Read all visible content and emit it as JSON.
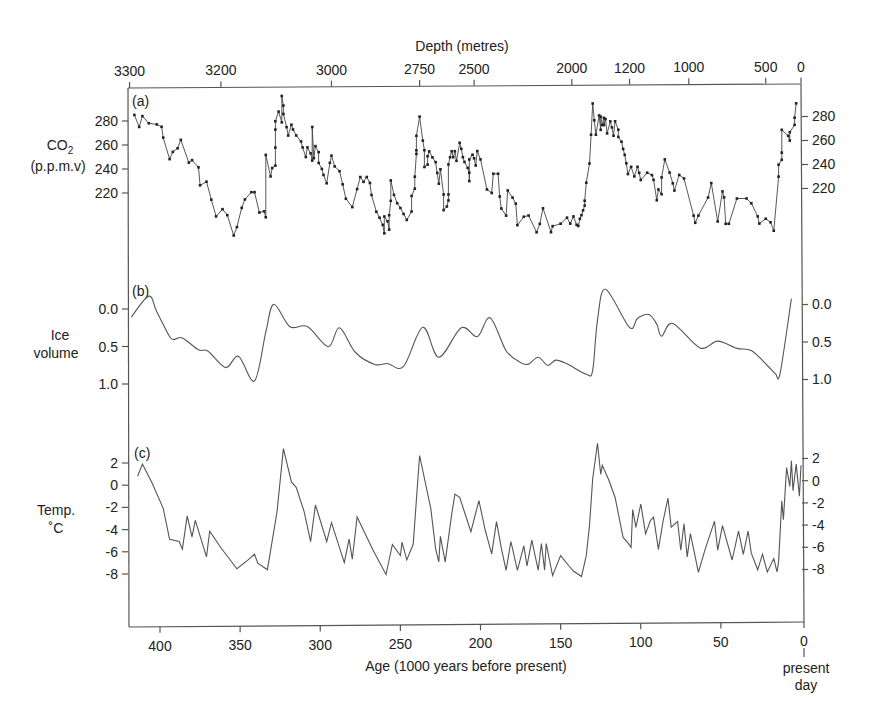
{
  "figure": {
    "top_axis_title": "Depth (metres)",
    "bottom_axis_title": "Age (1000 years before present)",
    "present_day_label_1": "present",
    "present_day_label_2": "day",
    "panels": {
      "a": {
        "tag": "(a)",
        "ylabel_main": "CO",
        "ylabel_sub": "2",
        "ylabel_unit": "(p.p.m.v)"
      },
      "b": {
        "tag": "(b)",
        "ylabel_1": "Ice",
        "ylabel_2": "volume"
      },
      "c": {
        "tag": "(c)",
        "ylabel_1": "Temp.",
        "ylabel_2": "˚C"
      }
    },
    "colors": {
      "line": "#555555",
      "marker": "#222222",
      "axis": "#555555",
      "background": "#ffffff"
    }
  },
  "chart_data": [
    {
      "panel": "(a)",
      "type": "line",
      "title": "",
      "xlabel": "Age (1000 years before present)",
      "ylabel": "CO2 (p.p.m.v)",
      "xlim": [
        420,
        0
      ],
      "ylim": [
        180,
        300
      ],
      "yticks": [
        220,
        240,
        260,
        280
      ],
      "markers": true,
      "secondary_xaxis": {
        "label": "Depth (metres)",
        "ticks": [
          {
            "label": "3300",
            "age": 419
          },
          {
            "label": "3200",
            "age": 362
          },
          {
            "label": "3000",
            "age": 293
          },
          {
            "label": "2750",
            "age": 238
          },
          {
            "label": "2500",
            "age": 204
          },
          {
            "label": "2000",
            "age": 143
          },
          {
            "label": "1200",
            "age": 107
          },
          {
            "label": "1000",
            "age": 70
          },
          {
            "label": "500",
            "age": 22
          },
          {
            "label": "0",
            "age": 0
          }
        ]
      },
      "x": [
        416,
        413,
        411,
        407,
        402,
        399,
        398,
        394,
        392,
        389,
        387,
        382,
        380,
        376,
        375,
        371,
        368,
        365,
        361,
        358,
        354,
        352,
        349,
        347,
        343,
        341,
        338,
        335,
        334,
        334,
        331,
        330,
        328,
        328,
        328,
        328,
        326,
        324,
        324,
        323,
        323,
        321,
        320,
        318,
        317,
        315,
        312,
        311,
        309,
        308,
        306,
        305,
        305,
        304,
        303,
        301,
        301,
        299,
        298,
        296,
        294,
        293,
        291,
        288,
        286,
        284,
        280,
        277,
        275,
        273,
        271,
        269,
        268,
        265,
        263,
        261,
        260,
        260,
        258,
        257,
        257,
        256,
        256,
        254,
        252,
        250,
        248,
        246,
        243,
        243,
        241,
        241,
        240,
        240,
        240,
        238,
        236,
        235,
        235,
        233,
        233,
        232,
        230,
        228,
        227,
        226,
        225,
        223,
        223,
        221,
        220,
        220,
        220,
        219,
        218,
        217,
        216,
        215,
        213,
        212,
        211,
        210,
        208,
        207,
        207,
        207,
        205,
        204,
        203,
        202,
        200,
        196,
        193,
        192,
        189,
        188,
        187,
        184,
        183,
        180,
        178,
        177,
        173,
        170,
        165,
        163,
        161,
        156,
        155,
        150,
        146,
        144,
        142,
        140,
        139,
        138,
        137,
        136,
        135,
        135,
        134,
        132,
        131,
        130,
        129,
        128,
        126,
        125,
        125,
        124,
        123,
        123,
        122,
        121,
        119,
        118,
        117,
        116,
        114,
        114,
        112,
        111,
        110,
        109,
        108,
        106,
        104,
        102,
        101,
        100,
        96,
        93,
        92,
        90,
        89,
        87,
        87,
        85,
        82,
        80,
        79,
        76,
        73,
        67,
        66,
        64,
        58,
        56,
        52,
        49,
        48,
        47,
        45,
        40,
        34,
        31,
        27,
        26,
        22,
        19,
        17,
        14,
        14,
        12,
        12,
        12,
        8,
        7,
        7,
        4,
        4,
        3
      ],
      "y": [
        285,
        275,
        284,
        278,
        277,
        275,
        266,
        248,
        254,
        257,
        264,
        245,
        247,
        241,
        226,
        229,
        214,
        200,
        206,
        201,
        184,
        191,
        207,
        214,
        220,
        220,
        203,
        204,
        199,
        251,
        233,
        240,
        242,
        257,
        272,
        279,
        287,
        278,
        300,
        292,
        285,
        274,
        267,
        276,
        272,
        267,
        262,
        257,
        249,
        257,
        252,
        246,
        274,
        248,
        258,
        253,
        244,
        239,
        234,
        227,
        244,
        250,
        241,
        237,
        226,
        214,
        207,
        222,
        232,
        228,
        232,
        227,
        217,
        203,
        198,
        192,
        185,
        199,
        195,
        188,
        200,
        212,
        229,
        217,
        210,
        206,
        201,
        196,
        203,
        216,
        222,
        232,
        251,
        254,
        266,
        282,
        262,
        254,
        240,
        242,
        249,
        253,
        248,
        244,
        235,
        226,
        238,
        217,
        204,
        207,
        212,
        217,
        242,
        248,
        253,
        248,
        253,
        245,
        260,
        255,
        248,
        244,
        239,
        235,
        228,
        246,
        250,
        247,
        241,
        253,
        246,
        221,
        218,
        234,
        234,
        215,
        205,
        199,
        220,
        214,
        209,
        191,
        198,
        199,
        185,
        192,
        205,
        185,
        190,
        192,
        197,
        192,
        198,
        191,
        190,
        196,
        199,
        203,
        207,
        211,
        226,
        242,
        266,
        292,
        278,
        266,
        282,
        270,
        281,
        274,
        280,
        274,
        279,
        267,
        277,
        272,
        265,
        277,
        270,
        264,
        260,
        254,
        249,
        242,
        233,
        239,
        231,
        239,
        234,
        228,
        234,
        232,
        228,
        211,
        220,
        216,
        230,
        245,
        234,
        225,
        219,
        232,
        229,
        198,
        192,
        198,
        213,
        225,
        193,
        218,
        213,
        191,
        191,
        212,
        212,
        208,
        197,
        191,
        195,
        192,
        185,
        230,
        240,
        244,
        250,
        269,
        264,
        260,
        267,
        273,
        279,
        291
      ]
    },
    {
      "panel": "(b)",
      "type": "line",
      "title": "",
      "xlabel": "Age (1000 years before present)",
      "ylabel": "Ice volume",
      "xlim": [
        420,
        0
      ],
      "ylim": [
        1.5,
        -0.3
      ],
      "yticks": [
        0.0,
        0.5,
        1.0
      ],
      "y_inverted": true,
      "markers": false,
      "x": [
        418,
        407,
        402,
        394,
        391,
        386,
        376,
        370,
        359,
        351,
        341,
        334,
        329,
        319,
        308,
        295,
        288,
        278,
        266,
        258,
        248,
        236,
        226,
        212,
        202,
        194,
        184,
        175,
        170,
        164,
        158,
        153,
        146,
        134,
        130,
        127,
        122,
        107,
        102,
        95,
        90,
        87,
        80,
        63,
        52,
        40,
        31,
        21,
        16,
        13,
        6
      ],
      "y": [
        0.11,
        -0.17,
        0.04,
        0.37,
        0.41,
        0.39,
        0.55,
        0.57,
        0.79,
        0.64,
        0.97,
        0.32,
        -0.05,
        0.25,
        0.25,
        0.52,
        0.27,
        0.6,
        0.76,
        0.75,
        0.79,
        0.27,
        0.67,
        0.28,
        0.4,
        0.15,
        0.59,
        0.75,
        0.77,
        0.68,
        0.79,
        0.72,
        0.77,
        0.91,
        0.86,
        0.19,
        -0.22,
        0.29,
        0.17,
        0.12,
        0.25,
        0.41,
        0.24,
        0.57,
        0.48,
        0.58,
        0.61,
        0.81,
        0.92,
        0.91,
        -0.08
      ]
    },
    {
      "panel": "(c)",
      "type": "line",
      "title": "",
      "xlabel": "Age (1000 years before present)",
      "ylabel": "Temp. ˚C",
      "xlim": [
        420,
        0
      ],
      "ylim": [
        -12,
        4
      ],
      "yticks": [
        2,
        0,
        -2,
        -4,
        -6,
        -8
      ],
      "markers": false,
      "x": [
        414,
        411,
        405,
        398,
        394,
        388,
        386,
        383,
        380,
        378,
        371,
        369,
        362,
        352,
        345,
        341,
        339,
        333,
        327,
        323,
        318,
        315,
        310,
        306,
        303,
        300,
        296,
        293,
        285,
        282,
        280,
        277,
        267,
        259,
        255,
        250,
        249,
        246,
        242,
        238,
        231,
        228,
        226,
        225,
        222,
        218,
        216,
        213,
        206,
        201,
        197,
        193,
        190,
        187,
        184,
        181,
        177,
        173,
        171,
        168,
        164,
        162,
        160,
        159,
        155,
        150,
        145,
        142,
        137,
        134,
        132,
        130,
        127,
        125,
        124,
        120,
        116,
        111,
        108,
        106,
        105,
        103,
        100,
        97,
        94,
        92,
        89,
        86,
        83,
        81,
        77,
        75,
        73,
        71,
        69,
        64,
        60,
        54,
        52,
        49,
        43,
        39,
        36,
        33,
        31,
        27,
        24,
        21,
        17,
        15,
        14,
        12,
        11,
        9,
        7,
        6,
        5,
        3,
        1,
        0
      ],
      "y": [
        0.8,
        1.9,
        0.2,
        -2.1,
        -4.9,
        -5.1,
        -5.8,
        -2.8,
        -4.7,
        -3.2,
        -6.5,
        -4.2,
        -5.7,
        -7.6,
        -6.8,
        -6.3,
        -7.1,
        -7.7,
        -2.5,
        3.2,
        0.2,
        -0.3,
        -2.5,
        -5.2,
        -1.9,
        -3.3,
        -5.2,
        -3.5,
        -7.1,
        -5.0,
        -6.8,
        -3.0,
        -6.0,
        -8.2,
        -5.5,
        -6.5,
        -5.3,
        -6.9,
        -5.5,
        2.5,
        -2.3,
        -5.9,
        -7.1,
        -4.8,
        -7.1,
        -2.8,
        -1.0,
        -1.3,
        -4.4,
        -1.6,
        -4.3,
        -6.4,
        -3.5,
        -5.9,
        -7.9,
        -5.3,
        -7.9,
        -5.7,
        -7.5,
        -5.2,
        -7.9,
        -5.5,
        -7.9,
        -5.5,
        -8.4,
        -6.6,
        -7.5,
        -8.0,
        -8.5,
        -6.6,
        -3.9,
        0.3,
        3.5,
        0.7,
        1.5,
        0.2,
        -1.4,
        -5.0,
        -5.5,
        -5.9,
        -2.5,
        -4.1,
        -2.0,
        -4.7,
        -3.5,
        -3.2,
        -6.1,
        -3.5,
        -1.5,
        -4.1,
        -3.6,
        -6.2,
        -3.8,
        -6.8,
        -4.7,
        -8.2,
        -6.2,
        -3.6,
        -6.2,
        -4.0,
        -7.1,
        -4.5,
        -6.6,
        -4.5,
        -6.5,
        -8.0,
        -6.6,
        -8.2,
        -7.0,
        -8.2,
        -7.3,
        -1.8,
        -3.5,
        1.2,
        -0.5,
        1.8,
        -0.9,
        1.5,
        -1.4,
        1.4
      ]
    }
  ],
  "axes": {
    "age_ticks": [
      "400",
      "350",
      "300",
      "250",
      "200",
      "150",
      "100",
      "50",
      "0"
    ],
    "age_tick_values": [
      400,
      350,
      300,
      250,
      200,
      150,
      100,
      50,
      0
    ],
    "co2_ticks": [
      "220",
      "240",
      "260",
      "280"
    ],
    "ice_ticks": [
      "0.0",
      "0.5",
      "1.0"
    ],
    "temp_ticks": [
      "2",
      "0",
      "-2",
      "-4",
      "-6",
      "-8"
    ]
  }
}
